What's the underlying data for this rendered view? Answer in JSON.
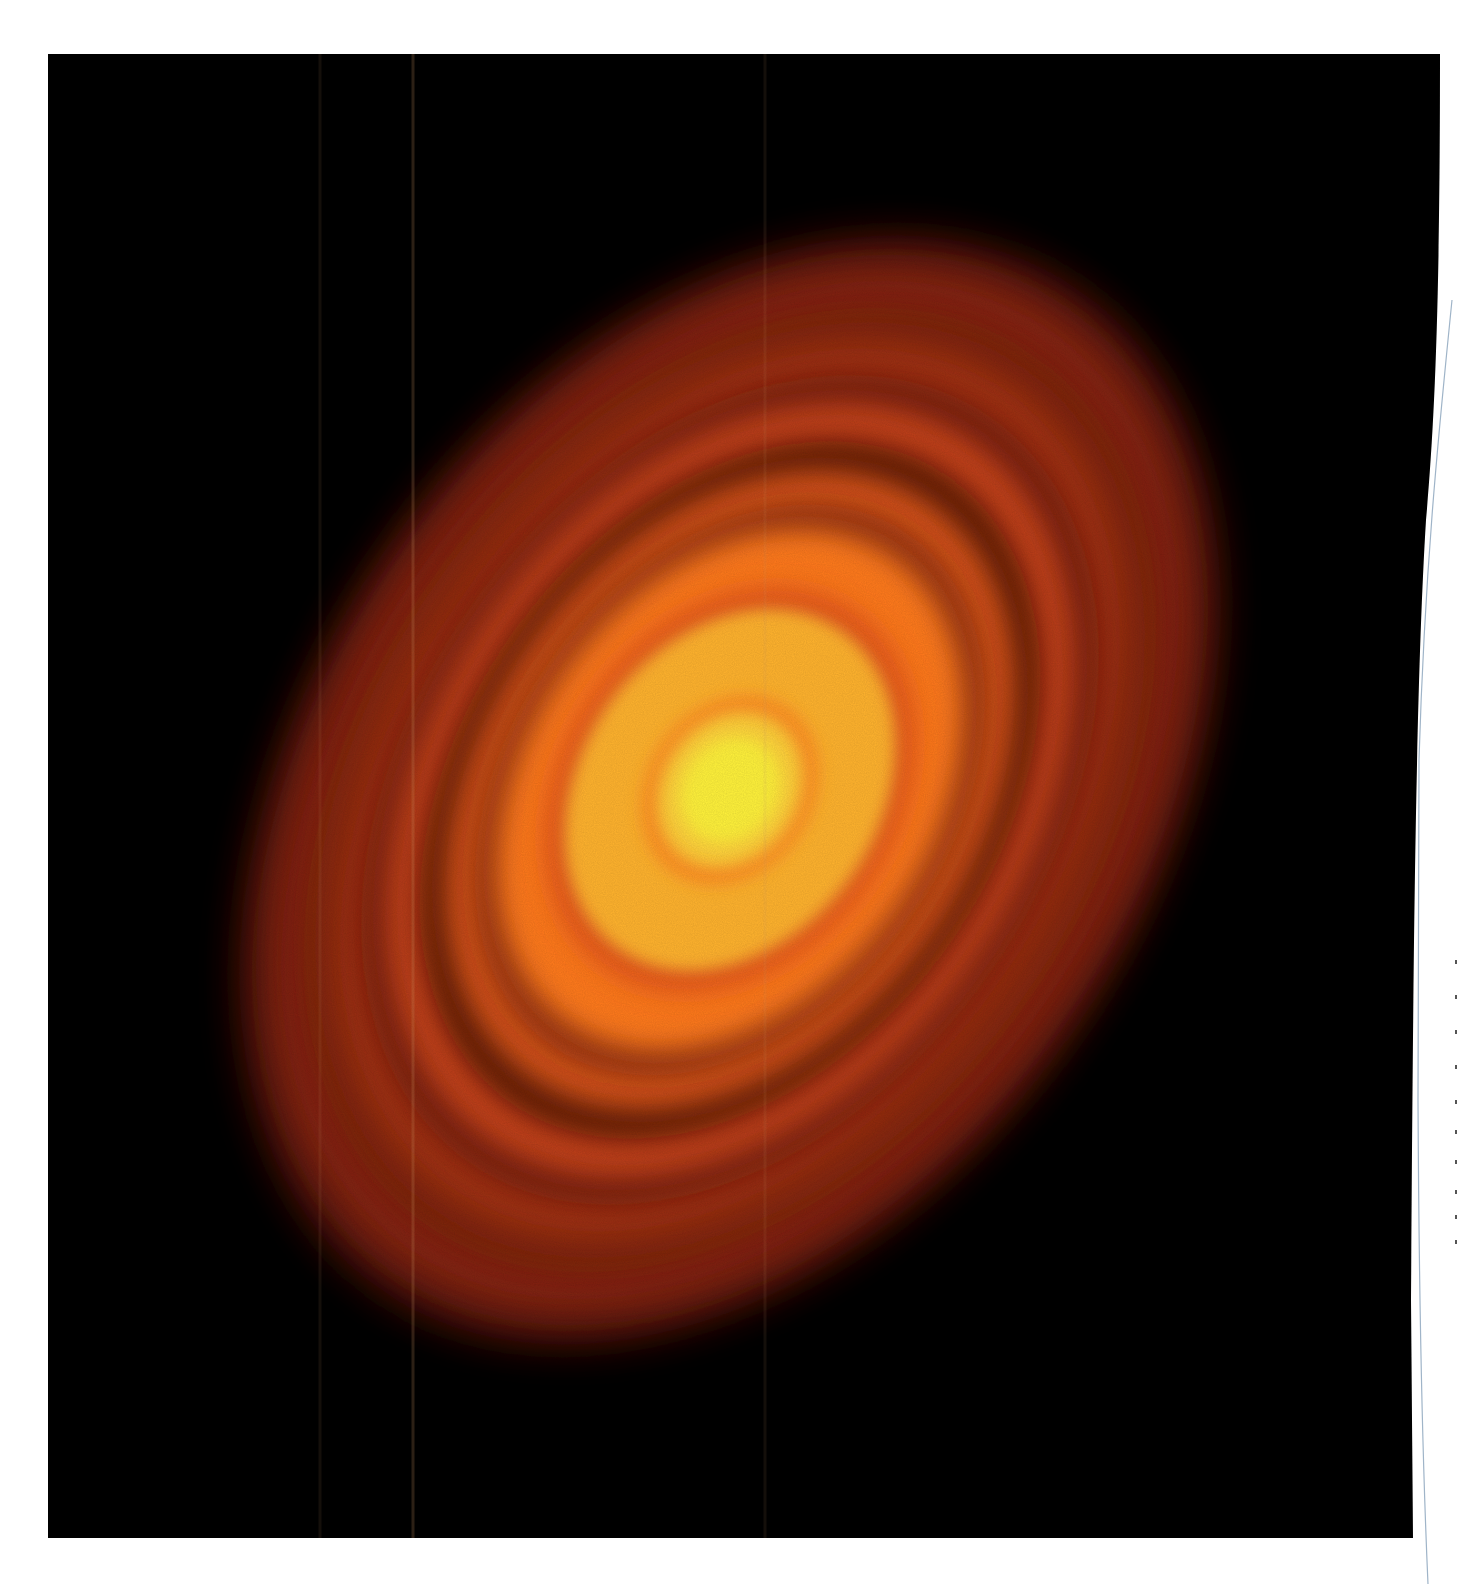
{
  "image": {
    "subject": "protoplanetary disc with concentric bright and dark rings",
    "width": 1457,
    "height": 1584,
    "background": "#ffffff"
  },
  "photo_panel": {
    "fill": "#000000",
    "left": 48,
    "top": 54,
    "right_top": 1440,
    "right_bottom": 1413,
    "bottom": 1538
  },
  "disc": {
    "center_x": 730,
    "center_y": 790,
    "rotation_deg": 35,
    "colors": {
      "core": "#fff23a",
      "inner_glow": "#ffd23a",
      "inner_band": "#ffb12e",
      "orange": "#ff7a1e",
      "mid_orange": "#f0641a",
      "red_orange": "#c8401a",
      "dark_gap": "#5a1208",
      "outer_dim": "#8a2410",
      "edge": "#3a0a04"
    },
    "rings": [
      {
        "name": "outer-halo",
        "rx": 420,
        "ry": 610,
        "color": "#5e160a",
        "opacity": 0.9
      },
      {
        "name": "outer-ring-4",
        "rx": 395,
        "ry": 575,
        "color": "#9a2e12",
        "opacity": 0.85
      },
      {
        "name": "outer-gap-4",
        "rx": 365,
        "ry": 530,
        "color": "#4a1006",
        "opacity": 0.55
      },
      {
        "name": "outer-ring-3",
        "rx": 345,
        "ry": 500,
        "color": "#b23a16",
        "opacity": 0.85
      },
      {
        "name": "outer-gap-3",
        "rx": 318,
        "ry": 455,
        "color": "#501107",
        "opacity": 0.6
      },
      {
        "name": "ring-2",
        "rx": 298,
        "ry": 425,
        "color": "#d04a1a",
        "opacity": 0.9
      },
      {
        "name": "gap-2",
        "rx": 268,
        "ry": 382,
        "color": "#3e0c05",
        "opacity": 0.8
      },
      {
        "name": "ring-1",
        "rx": 248,
        "ry": 350,
        "color": "#e05a1a",
        "opacity": 0.95
      },
      {
        "name": "gap-1",
        "rx": 222,
        "ry": 312,
        "color": "#6a1a08",
        "opacity": 0.7
      },
      {
        "name": "orange-band",
        "rx": 205,
        "ry": 285,
        "color": "#ff7a1e",
        "opacity": 1
      },
      {
        "name": "inner-dark-ring",
        "rx": 165,
        "ry": 215,
        "color": "#e0501a",
        "opacity": 1
      },
      {
        "name": "inner-yellow-band",
        "rx": 150,
        "ry": 195,
        "color": "#ffb32e",
        "opacity": 1
      },
      {
        "name": "innermost-gap",
        "rx": 82,
        "ry": 100,
        "color": "#ff8a24",
        "opacity": 0.9
      },
      {
        "name": "inner-glow",
        "rx": 68,
        "ry": 82,
        "color": "#ffd03a",
        "opacity": 1
      },
      {
        "name": "core",
        "rx": 48,
        "ry": 56,
        "color": "#fff23a",
        "opacity": 1
      }
    ]
  },
  "scan_artifacts": {
    "streak_color": "#c89060",
    "streaks_x": [
      320,
      413,
      765
    ]
  },
  "page_edge": {
    "line_color": "#9fb4c8",
    "tick_color": "#555555",
    "tick_y": [
      960,
      995,
      1030,
      1065,
      1100,
      1130,
      1160,
      1190,
      1215,
      1240
    ]
  }
}
